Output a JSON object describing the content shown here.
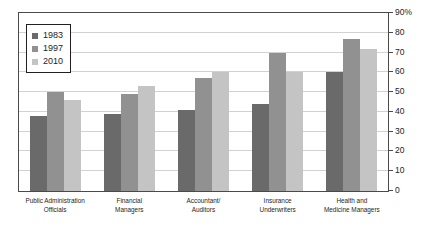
{
  "chart_data": {
    "type": "bar",
    "title": "",
    "xlabel": "",
    "ylabel": "",
    "ylim": [
      0,
      90
    ],
    "ytick_labels": [
      "90%",
      "80",
      "70",
      "60",
      "50",
      "40",
      "30",
      "20",
      "10",
      "0"
    ],
    "ytick_values": [
      90,
      80,
      70,
      60,
      50,
      40,
      30,
      20,
      10,
      0
    ],
    "grid": true,
    "legend_position": "top-left",
    "categories": [
      "Public Administration Officials",
      "Financial Managers",
      "Accountant/ Auditors",
      "Insurance Underwriters",
      "Health and Medicine Managers"
    ],
    "category_lines": [
      [
        "Public Administration",
        "Officials"
      ],
      [
        "Financial",
        "Managers"
      ],
      [
        "Accountant/",
        "Auditors"
      ],
      [
        "Insurance",
        "Underwriters"
      ],
      [
        "Health and",
        "Medicine Managers"
      ]
    ],
    "series": [
      {
        "name": "1983",
        "color": "#6a6a6a",
        "values": [
          38,
          39,
          41,
          44,
          60
        ]
      },
      {
        "name": "1997",
        "color": "#919191",
        "values": [
          50,
          49,
          57,
          70,
          77
        ]
      },
      {
        "name": "2010",
        "color": "#c4c4c4",
        "values": [
          46,
          53,
          60,
          60,
          72
        ]
      }
    ]
  },
  "legend": {
    "items": [
      {
        "label": "1983",
        "color": "#6a6a6a"
      },
      {
        "label": "1997",
        "color": "#919191"
      },
      {
        "label": "2010",
        "color": "#c4c4c4"
      }
    ]
  },
  "axis": {
    "frame_color": "#4a4a4a",
    "gridline_color": "#d2d2d2"
  }
}
